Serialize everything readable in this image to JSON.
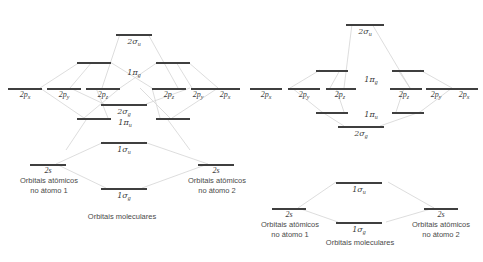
{
  "figure": {
    "stroke_color": "#3f3f3f",
    "connector_color": "#d0d0d0",
    "text_color": "#3a3a3a"
  },
  "diagrams": [
    {
      "id": "left-diagram",
      "name": "mo-diagram-left",
      "description": "Diagrama de orbitais moleculares com 1pi_u abaixo de 2sigma_g",
      "captions": {
        "left_atom_line1": "Orbitais atômicos",
        "left_atom_line2": "no átomo 1",
        "right_atom_line1": "Orbitais atômicos",
        "right_atom_line2": "no átomo 2",
        "molecular": "Orbitais moleculares"
      },
      "atomic_left": [
        {
          "label": "2p",
          "sub": "x",
          "name": "ao-left-2px"
        },
        {
          "label": "2p",
          "sub": "y",
          "name": "ao-left-2py"
        },
        {
          "label": "2p",
          "sub": "z",
          "name": "ao-left-2pz"
        },
        {
          "label": "2s",
          "sub": "",
          "name": "ao-left-2s"
        }
      ],
      "atomic_right": [
        {
          "label": "2p",
          "sub": "z",
          "name": "ao-right-2pz"
        },
        {
          "label": "2p",
          "sub": "y",
          "name": "ao-right-2py"
        },
        {
          "label": "2p",
          "sub": "x",
          "name": "ao-right-2px"
        },
        {
          "label": "2s",
          "sub": "",
          "name": "ao-right-2s"
        }
      ],
      "molecular": [
        {
          "label": "2σ",
          "sub": "u",
          "name": "mo-2sigma-u",
          "degeneracy": 1
        },
        {
          "label": "1π",
          "sub": "g",
          "name": "mo-1pi-g",
          "degeneracy": 2
        },
        {
          "label": "2σ",
          "sub": "g",
          "name": "mo-2sigma-g",
          "degeneracy": 1
        },
        {
          "label": "1π",
          "sub": "u",
          "name": "mo-1pi-u",
          "degeneracy": 2
        },
        {
          "label": "1σ",
          "sub": "u",
          "name": "mo-1sigma-u",
          "degeneracy": 1
        },
        {
          "label": "1σ",
          "sub": "g",
          "name": "mo-1sigma-g",
          "degeneracy": 1
        }
      ]
    },
    {
      "id": "right-diagram",
      "name": "mo-diagram-right",
      "description": "Diagrama de orbitais moleculares com 2sigma_g abaixo de 1pi_u",
      "captions": {
        "left_atom_line1": "Orbitais atômicos",
        "left_atom_line2": "no átomo 1",
        "right_atom_line1": "Orbitais atômicos",
        "right_atom_line2": "no átomo 2",
        "molecular": "Orbitais moleculares"
      },
      "atomic_left": [
        {
          "label": "2p",
          "sub": "x",
          "name": "ao-left-2px"
        },
        {
          "label": "2p",
          "sub": "y",
          "name": "ao-left-2py"
        },
        {
          "label": "2p",
          "sub": "z",
          "name": "ao-left-2pz"
        },
        {
          "label": "2s",
          "sub": "",
          "name": "ao-left-2s"
        }
      ],
      "atomic_right": [
        {
          "label": "2p",
          "sub": "z",
          "name": "ao-right-2pz"
        },
        {
          "label": "2p",
          "sub": "y",
          "name": "ao-right-2py"
        },
        {
          "label": "2p",
          "sub": "x",
          "name": "ao-right-2px"
        },
        {
          "label": "2s",
          "sub": "",
          "name": "ao-right-2s"
        }
      ],
      "molecular": [
        {
          "label": "2σ",
          "sub": "u",
          "name": "mo-2sigma-u",
          "degeneracy": 1
        },
        {
          "label": "1π",
          "sub": "g",
          "name": "mo-1pi-g",
          "degeneracy": 2
        },
        {
          "label": "1π",
          "sub": "u",
          "name": "mo-1pi-u",
          "degeneracy": 2
        },
        {
          "label": "2σ",
          "sub": "g",
          "name": "mo-2sigma-g",
          "degeneracy": 1
        },
        {
          "label": "1σ",
          "sub": "u",
          "name": "mo-1sigma-u",
          "degeneracy": 1
        },
        {
          "label": "1σ",
          "sub": "g",
          "name": "mo-1sigma-g",
          "degeneracy": 1
        }
      ]
    }
  ],
  "labels": {
    "L_2px_a": "2p",
    "L_2px_a_sub": "x",
    "L_2py_a": "2p",
    "L_2py_a_sub": "y",
    "L_2pz_a": "2p",
    "L_2pz_a_sub": "z",
    "L_2pz_b": "2p",
    "L_2pz_b_sub": "z",
    "L_2py_b": "2p",
    "L_2py_b_sub": "y",
    "L_2px_b": "2p",
    "L_2px_b_sub": "x",
    "L_2s_a": "2s",
    "L_2s_b": "2s",
    "L_2su": "2σ",
    "L_2su_sub": "u",
    "L_1pg": "1π",
    "L_1pg_sub": "g",
    "L_2sg": "2σ",
    "L_2sg_sub": "g",
    "L_1pu": "1π",
    "L_1pu_sub": "u",
    "L_1su": "1σ",
    "L_1su_sub": "u",
    "L_1sg": "1σ",
    "L_1sg_sub": "g",
    "R_2px_a": "2p",
    "R_2px_a_sub": "x",
    "R_2py_a": "2p",
    "R_2py_a_sub": "y",
    "R_2pz_a": "2p",
    "R_2pz_a_sub": "z",
    "R_2pz_b": "2p",
    "R_2pz_b_sub": "z",
    "R_2py_b": "2p",
    "R_2py_b_sub": "y",
    "R_2px_b": "2p",
    "R_2px_b_sub": "x",
    "R_2s_a": "2s",
    "R_2s_b": "2s",
    "R_2su": "2σ",
    "R_2su_sub": "u",
    "R_1pg": "1π",
    "R_1pg_sub": "g",
    "R_1pu": "1π",
    "R_1pu_sub": "u",
    "R_2sg": "2σ",
    "R_2sg_sub": "g",
    "R_1su": "1σ",
    "R_1su_sub": "u",
    "R_1sg": "1σ",
    "R_1sg_sub": "g"
  },
  "captions": {
    "L_atom1_l1": "Orbitais atômicos",
    "L_atom1_l2": "no átomo 1",
    "L_atom2_l1": "Orbitais atômicos",
    "L_atom2_l2": "no átomo 2",
    "L_mol": "Orbitais moleculares",
    "R_atom1_l1": "Orbitais atômicos",
    "R_atom1_l2": "no átomo 1",
    "R_atom2_l1": "Orbitais atômicos",
    "R_atom2_l2": "no átomo 2",
    "R_mol": "Orbitais moleculares"
  }
}
